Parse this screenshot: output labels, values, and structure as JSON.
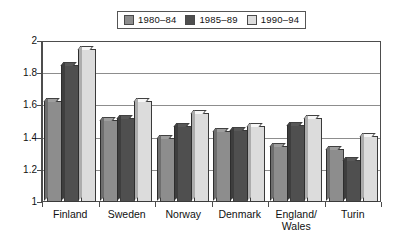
{
  "chart_data": {
    "type": "bar",
    "title": "",
    "subtitle": "",
    "xlabel": "",
    "ylabel": "",
    "ylim": [
      1,
      2
    ],
    "yticks": [
      "1",
      "1.2",
      "1.4",
      "1.6",
      "1.8",
      "2"
    ],
    "grid": "horizontal",
    "legend_position": "top-center",
    "categories": [
      "Finland",
      "Sweden",
      "Norway",
      "Denmark",
      "England/ Wales",
      "Turin"
    ],
    "series": [
      {
        "name": "1980–84",
        "color": "#8d8d8d",
        "values": [
          1.63,
          1.51,
          1.4,
          1.44,
          1.35,
          1.33
        ]
      },
      {
        "name": "1985–89",
        "color": "#4f4f4f",
        "values": [
          1.85,
          1.52,
          1.47,
          1.45,
          1.48,
          1.26
        ]
      },
      {
        "name": "1990–94",
        "color": "#dcdcdc",
        "values": [
          1.95,
          1.63,
          1.55,
          1.47,
          1.52,
          1.41
        ]
      }
    ]
  },
  "legend": {
    "items": [
      {
        "label": "1980–84"
      },
      {
        "label": "1985–89"
      },
      {
        "label": "1990–94"
      }
    ]
  },
  "axes": {
    "y": {
      "ticks": [
        "2",
        "1.8",
        "1.6",
        "1.4",
        "1.2",
        "1"
      ]
    },
    "x": {
      "labels": [
        {
          "line1": "Finland",
          "line2": ""
        },
        {
          "line1": "Sweden",
          "line2": ""
        },
        {
          "line1": "Norway",
          "line2": ""
        },
        {
          "line1": "Denmark",
          "line2": ""
        },
        {
          "line1": "England/",
          "line2": "Wales"
        },
        {
          "line1": "Turin",
          "line2": ""
        }
      ]
    }
  },
  "colors": {
    "series1": "#8d8d8d",
    "series2": "#4f4f4f",
    "series3": "#dcdcdc",
    "axis": "#4d4d4d",
    "grid": "#8d8d8d",
    "background": "#ffffff"
  }
}
